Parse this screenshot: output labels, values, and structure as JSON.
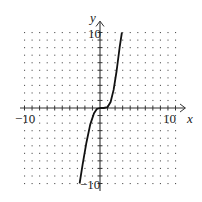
{
  "chart_data": {
    "type": "line",
    "title": "",
    "xlabel": "x",
    "ylabel": "y",
    "xlim": [
      -10,
      10
    ],
    "ylim": [
      -10,
      10
    ],
    "grid": "dotted",
    "tick_labels": {
      "x_min": "-10",
      "x_max": "10",
      "y_min": "-10",
      "y_max": "10"
    },
    "series": [
      {
        "name": "f(x)",
        "x": [
          -2.7,
          -2.3,
          -1.8,
          -1.3,
          -0.8,
          -0.4,
          0,
          0.5,
          1.0,
          1.4,
          1.8,
          2.2,
          2.6,
          2.9
        ],
        "y": [
          -10,
          -7.5,
          -4.6,
          -2.2,
          -0.7,
          -0.1,
          0,
          0,
          0.1,
          0.8,
          2.4,
          4.9,
          8.0,
          10
        ]
      }
    ]
  },
  "labels": {
    "x_axis": "x",
    "y_axis": "y",
    "x_min": "−10",
    "x_max": "10",
    "y_min": "−10",
    "y_max": "10"
  }
}
